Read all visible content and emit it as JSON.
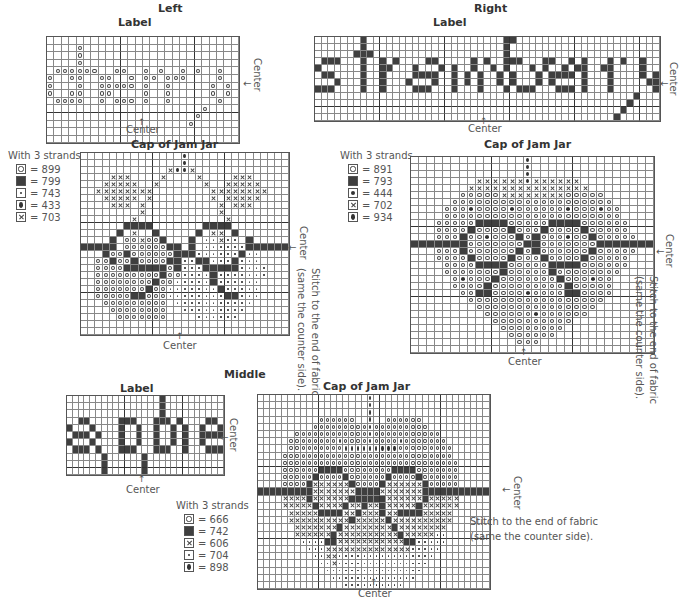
{
  "sections": {
    "left": {
      "title": "Left",
      "label": {
        "title": "Label",
        "center_bottom": "Center",
        "center_right": "Center",
        "word": "cherry",
        "rows": [
          "..........................",
          "....O.....................",
          "....O.....................",
          "....O.....................",
          ".OOOOOO..OO..O.O..O.O..O..O",
          "O..OO..OO..O.OO.OOO....O..O",
          "O...O..OOOOO.O..O.....O.O.",
          "O..OO..OO....O..O.....O.O.",
          ".OOOO..O.OOO.O..O......O..",
          ".....................O....",
          "....................O.....",
          "...................O......",
          "..........................",
          ".........................."
        ]
      },
      "cap": {
        "title": "Cap of Jam Jar",
        "center_bottom": "Center",
        "center_right": "Center",
        "side_note_1": "Stitch to the end of fabric",
        "side_note_2": "(same the counter side).",
        "legend": {
          "heading": "With 3 strands",
          "items": [
            {
              "symbol": "O",
              "symbol_name": "open-circle",
              "code": "= 899"
            },
            {
              "symbol": "F",
              "symbol_name": "filled-square",
              "code": "= 799"
            },
            {
              "symbol": "D",
              "symbol_name": "small-dot",
              "code": "= 743"
            },
            {
              "symbol": "Q",
              "symbol_name": "filled-oval",
              "code": "= 433"
            },
            {
              "symbol": "X",
              "symbol_name": "cross",
              "code": "= 703"
            }
          ]
        },
        "rows": [
          "..............Q..............",
          "..............Q..............",
          "............XQQX.............",
          "....XXX....X....X....XXX.....",
          "...XXXXX..X......X..XXXXX....",
          "..XXXXXXXX........XXXXXXXX...",
          "...XXXXX.X........X.XXXXX....",
          "....XXX.X..........X.XXX.....",
          "........X..........X.........",
          ".......X............X........",
          "......FFFF.......FFFF........",
          ".....F.X..F.....F.XX.F.......",
          "....F.OOXOOF...F.DDXDD.F.....",
          "FFFFF.OOOOOOFF.F.DDDDDDFFFFFF",
          "...FOOFOOOOOOFFFDDDDDDFDD....",
          "..OOFOOFOOOOFFDDFFDDDFDDD....",
          "..OOOOFFFFFFOFDDDFFFFFDDDD...",
          "..OOOOOOOOOFOODDDDFDDDDDDD...",
          "..OOOOOOOOFOODDDDDFDDDDDD....",
          "..OOOOOOOFOODDDDDDDFDDDDD....",
          "..OOOOOFFOOODDDDDDDDFFDDD....",
          "...OOOOOOOOO.DDDDDDDDDDD.....",
          "....OOOOOOOO..DDDDDDDDD......",
          ".....OOOOOOO....DDDDDD.......",
          ".............................",
          "............................."
        ]
      }
    },
    "right": {
      "title": "Right",
      "label": {
        "title": "Label",
        "center_bottom": "Center",
        "center_right": "Center",
        "word": "strawberry",
        "rows": [
          ".......F.....................FF....................",
          ".......F.....................F.....................",
          "......FFF....................F.....................",
          ".FFF...F..F.F....FF.....F.F..FFF...FF..F.F...F.F..F",
          "F......F..FF...F...F.F..F..F.F...F.F..F.FF..FF....F",
          ".FF....F..F....FFFF..F.F.F..F.F...F.FFFF.F...F....F.F",
          "...F...F..F...F...F..F.F.F..F.F...F.F....F...F.....FF",
          "FFF....F..F....FFF...F...F...F.FFF...FFF.F...F......F",
          ".................................................F...",
          "................................................F....",
          "...............................................F.....",
          "..............................................F......"
        ]
      },
      "cap": {
        "title": "Cap of Jam Jar",
        "center_bottom": "Center",
        "center_right": "Center",
        "side_note_1": "Stitch to the end of fabric",
        "side_note_2": "(same the counter side).",
        "legend": {
          "heading": "With 3 strands",
          "items": [
            {
              "symbol": "O",
              "symbol_name": "open-circle",
              "code": "= 891"
            },
            {
              "symbol": "F",
              "symbol_name": "filled-square",
              "code": "= 793"
            },
            {
              "symbol": "B",
              "symbol_name": "filled-circle",
              "code": "= 444"
            },
            {
              "symbol": "X",
              "symbol_name": "cross",
              "code": "= 702"
            },
            {
              "symbol": "Q",
              "symbol_name": "filled-oval",
              "code": "= 934"
            }
          ]
        },
        "rows": [
          "..............Q..............",
          "..............Q..............",
          "..............Q..............",
          "........XXXXXXQXXXXXX........",
          ".......XXXXXXXXXXXXXXX.......",
          "......OOOOOXXXXXXXXOOOOO.....",
          ".....OOOOOOOOOOOOOOOOOOOO....",
          "....OOOBOOOOBOOOOOOBOOOBOO...",
          "....OOOOOOOOOOOOOOOOOOOOOO...",
          "...OOOOOFFFFOOOOOFFFFOOOOOO..",
          "...OOOOFOOOOFOOOFOOOOFOOOOO..",
          "...OOOFOOBOOOFOFOOOBOOFOOOOO.",
          "FFFFFFFOOOOOOOFFOOOOOOOFFFFFFF",
          "...OOOFOOOOOOFOFOOOOOOFOOOOO.",
          "...OOOOFOOOOFOOOFOOOOFOOOOO..",
          "....OOOOFFFFOOOOOFFFFOOOOOO..",
          "....OOOOOOOFOOOOOFOOOOOOOO...",
          ".....OBOOOFOOOOOOOFOOOBOO....",
          ".....OOOOFOOOOOOOOOFOOOOO....",
          "......OOFFOOOOBOOOOFFOOOO....",
          ".......OOOOOOOOOOOOOOOOO.....",
          "........OOOOOOOOOOOOOOO......",
          ".........OOOOOOBOOOOOO.......",
          "..........OOOOOOOOOO.........",
          "...........OOOOOOOO..........",
          "............OOOOOO...........",
          ".............OOO.............",
          "............................."
        ]
      }
    },
    "middle": {
      "title": "Middle",
      "label": {
        "title": "Label",
        "center_bottom": "Center",
        "center_right": "Center",
        "word": "apple",
        "rows": [
          "................F......",
          "................F......",
          "................F......",
          "..FF.....FFF...FFF.F....FF.",
          "F...F....F..F..F..F.F..F..F",
          ".FFF.F...F..F..F..F.F..FFFF",
          "F...F....F..F..F..F.F..F...",
          ".FFF.F...FFF...FFF..F...FFF",
          "......F......F.............",
          "......F......F.............",
          "......F......F............."
        ]
      },
      "cap": {
        "title": "Cap of Jam Jar",
        "center_bottom": "Center",
        "center_right": "Center",
        "side_note_1": "Stitch to the end of fabric",
        "side_note_2": "(same the counter side).",
        "legend": {
          "heading": "With 3 strands",
          "items": [
            {
              "symbol": "O",
              "symbol_name": "open-circle",
              "code": "= 666"
            },
            {
              "symbol": "F",
              "symbol_name": "filled-square",
              "code": "= 742"
            },
            {
              "symbol": "X",
              "symbol_name": "cross",
              "code": "= 606"
            },
            {
              "symbol": "D",
              "symbol_name": "small-dot",
              "code": "= 704"
            },
            {
              "symbol": "Q",
              "symbol_name": "filled-oval",
              "code": "= 898"
            }
          ]
        },
        "rows": [
          "..................Q...................",
          "..................Q...................",
          "..................Q...................",
          "..........OOOOOO..Q..OOOOOO...........",
          ".........OOOOOOOOOQOOOOOOOOO..........",
          "......OOOOOOOOOOOOQOOOOOOOOOOO........",
          ".....OOOOOOOOQOOOOQOOOOQOOOOOOO.......",
          ".....OOOOOOOOOQQQQQQQQQOOOOOOOOO......",
          "....OOOOOOOOOOOOOOOOOOOOOOOOOOOO......",
          "....OOOOOOOOOOOOOOOOOOOOOOOOOOOOO.....",
          "....OOOOOOFFFFOOOOOOOOFFFFOOOOOOO.....",
          "....OOOOOFOOOOFOOOOOOFOOOOFOOOOOO.....",
          "....OOOOFXXXXXXFOOOOFXXXXXXFOOOOO.....",
          "FFFFFFFFFXXXXXXXFFFFXXXXXXXFFFFFFFFFFF",
          "....XXXXFXXXXXXFFFFFFXXXXXXFXXXXX.....",
          "....XXXXXFXXXXFXXFXXFXXXXXFXXXXXX.....",
          ".....XXXXXFFFFXXFXXXFXXFFFFXXXXX......",
          ".....XXXXXXXXXXFXXXXXFXXXXXXXXXX......",
          "......XXXXXXXFXXXXXXXXFXXXXXXXX.......",
          "......XXXXXXFXXXXXXXXXXFXXXXXDD.......",
          ".......DDDDFFXXXXXXXXXXXFFDDDDD.......",
          "........DDDXXXXXXXXXXXXXXDDDDD........",
          ".........DDXXDDDDDDDDDDDDDDDD.........",
          "..........DDXDDDDDDDDDDDDDDD..........",
          "...........DDDDDDDDDDDDDDDD...........",
          "............DDDDDDDDDDDDDD............",
          "..............DDDDDDDDDD.............."
        ]
      }
    }
  }
}
